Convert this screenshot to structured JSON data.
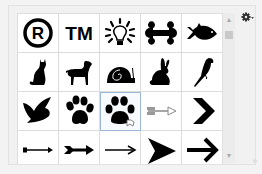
{
  "panel": {
    "title": "Custom Shape Picker",
    "selected_index": 12
  },
  "shapes": [
    {
      "name": "registered-trademark",
      "label": "Registered Trademark"
    },
    {
      "name": "trademark",
      "label": "TM"
    },
    {
      "name": "lightbulb",
      "label": "Lightbulb"
    },
    {
      "name": "bone",
      "label": "Bone"
    },
    {
      "name": "fish",
      "label": "Fish"
    },
    {
      "name": "cat",
      "label": "Cat"
    },
    {
      "name": "dog",
      "label": "Dog"
    },
    {
      "name": "snail",
      "label": "Snail"
    },
    {
      "name": "rabbit",
      "label": "Rabbit"
    },
    {
      "name": "bird-parrot",
      "label": "Bird 2"
    },
    {
      "name": "bird-flying",
      "label": "Bird"
    },
    {
      "name": "paw-print",
      "label": "Paw Print"
    },
    {
      "name": "paw-print-2",
      "label": "Paw Print 2"
    },
    {
      "name": "arrow-feathered",
      "label": "Arrow 1"
    },
    {
      "name": "chevron-right",
      "label": "Arrow 2"
    },
    {
      "name": "arrow-thin",
      "label": "Arrow 3"
    },
    {
      "name": "arrow-fletched",
      "label": "Arrow 4"
    },
    {
      "name": "arrow-line",
      "label": "Arrow 5"
    },
    {
      "name": "arrow-head",
      "label": "Arrow 6"
    },
    {
      "name": "arrow-bold",
      "label": "Arrow 7"
    }
  ],
  "scrollbar": {
    "up": "▲",
    "down": "▼"
  },
  "menu": {
    "icon": "gear-icon"
  },
  "colors": {
    "selection_border": "#9db7d8",
    "shape_fill": "#000000"
  }
}
